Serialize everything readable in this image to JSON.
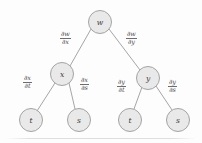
{
  "diagram": {
    "type": "tree",
    "background_color": "#fdfdfd",
    "node_fill_color": "#e9e9e9",
    "node_stroke_color": "#9b9b9b",
    "edge_color": "#9b9b9b",
    "text_color": "#3a3a3a",
    "nodes": [
      {
        "id": "w",
        "label": "w",
        "cx": 100,
        "cy": 22,
        "r": 11.5,
        "level": 0
      },
      {
        "id": "x",
        "label": "x",
        "cx": 62,
        "cy": 74,
        "r": 11.5,
        "level": 1
      },
      {
        "id": "y",
        "label": "y",
        "cx": 148,
        "cy": 78,
        "r": 11.5,
        "level": 1
      },
      {
        "id": "t1",
        "label": "t",
        "cx": 31,
        "cy": 120,
        "r": 11.5,
        "level": 2
      },
      {
        "id": "s1",
        "label": "s",
        "cx": 79,
        "cy": 120,
        "r": 11.5,
        "level": 2
      },
      {
        "id": "t2",
        "label": "t",
        "cx": 130,
        "cy": 120,
        "r": 11.5,
        "level": 2
      },
      {
        "id": "s2",
        "label": "s",
        "cx": 178,
        "cy": 120,
        "r": 11.5,
        "level": 2
      }
    ],
    "edges": [
      {
        "id": "w-x",
        "from": "w",
        "to": "x",
        "x1": 91,
        "y1": 29,
        "x2": 70,
        "y2": 66
      },
      {
        "id": "w-y",
        "from": "w",
        "to": "y",
        "x1": 109,
        "y1": 29,
        "x2": 140,
        "y2": 70
      },
      {
        "id": "x-t",
        "from": "x",
        "to": "t1",
        "x1": 55,
        "y1": 83,
        "x2": 37,
        "y2": 111
      },
      {
        "id": "x-s",
        "from": "x",
        "to": "s1",
        "x1": 69,
        "y1": 83,
        "x2": 75,
        "y2": 109
      },
      {
        "id": "y-t",
        "from": "y",
        "to": "t2",
        "x1": 142,
        "y1": 87,
        "x2": 134,
        "y2": 109
      },
      {
        "id": "y-s",
        "from": "y",
        "to": "s2",
        "x1": 156,
        "y1": 86,
        "x2": 172,
        "y2": 110
      }
    ],
    "edge_labels": [
      {
        "id": "dw-dx",
        "numerator": "∂w",
        "denominator": "∂x",
        "edge": "w-x",
        "left": 60,
        "top": 31
      },
      {
        "id": "dw-dy",
        "numerator": "∂w",
        "denominator": "∂y",
        "edge": "w-y",
        "left": 126,
        "top": 31
      },
      {
        "id": "dx-dt",
        "numerator": "∂x",
        "denominator": "∂t",
        "edge": "x-t",
        "left": 23,
        "top": 75
      },
      {
        "id": "dx-ds",
        "numerator": "∂x",
        "denominator": "∂s",
        "edge": "x-s",
        "left": 80,
        "top": 77
      },
      {
        "id": "dy-dt",
        "numerator": "∂y",
        "denominator": "∂t",
        "edge": "y-t",
        "left": 117,
        "top": 79
      },
      {
        "id": "dy-ds",
        "numerator": "∂y",
        "denominator": "∂s",
        "edge": "y-s",
        "left": 168,
        "top": 79
      }
    ]
  }
}
